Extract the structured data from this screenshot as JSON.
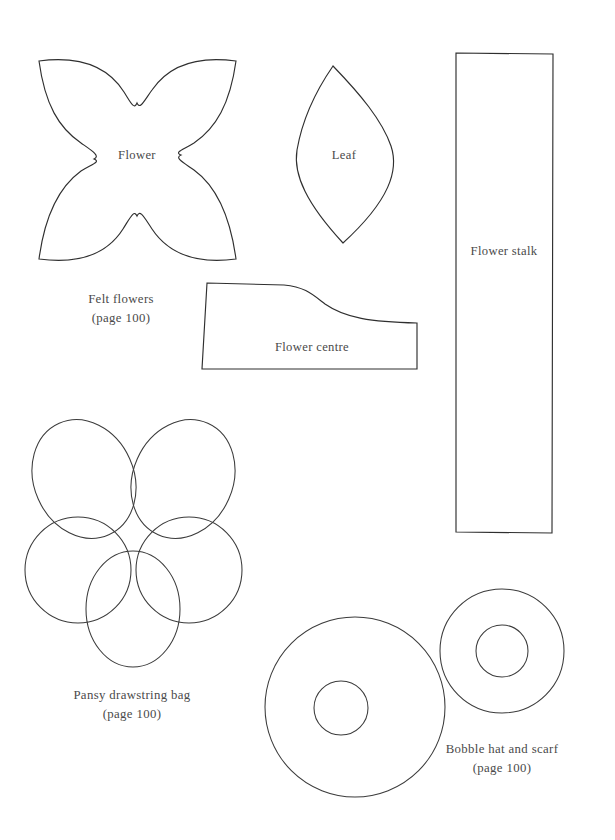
{
  "page": {
    "background_color": "#ffffff",
    "ink_color": "#2f2f2f",
    "text_color": "#4a4a4a",
    "width": 615,
    "height": 840,
    "document_type": "sewing pattern template sheet"
  },
  "shape_labels": {
    "flower": "Flower",
    "leaf": "Leaf",
    "flower_stalk": "Flower stalk",
    "flower_centre": "Flower centre"
  },
  "captions": [
    {
      "id": "felt-flowers",
      "title": "Felt flowers",
      "page_ref": "(page 100)"
    },
    {
      "id": "pansy-drawstring-bag",
      "title": "Pansy drawstring bag",
      "page_ref": "(page 100)"
    },
    {
      "id": "bobble-hat-and-scarf",
      "title": "Bobble hat and scarf",
      "page_ref": "(page 100)"
    }
  ],
  "shapes": {
    "flower": {
      "name": "four-petal flower template",
      "bounds": {
        "x": 36,
        "y": 58,
        "w": 202,
        "h": 204
      }
    },
    "leaf": {
      "name": "pointed leaf template",
      "bounds": {
        "x": 293,
        "y": 66,
        "w": 104,
        "h": 177
      }
    },
    "flower_stalk": {
      "name": "flower stalk rectangle template",
      "bounds": {
        "x": 455,
        "y": 53,
        "w": 98,
        "h": 480
      }
    },
    "flower_centre": {
      "name": "flower centre wedge template",
      "bounds": {
        "x": 202,
        "y": 283,
        "w": 215,
        "h": 87
      }
    },
    "pansy": {
      "name": "pansy five-petal template",
      "bounds": {
        "x": 25,
        "y": 418,
        "w": 230,
        "h": 245
      }
    },
    "bobble_large": {
      "name": "large bobble ring template",
      "center": {
        "x": 355,
        "y": 707
      },
      "outer_radius": 90,
      "inner_radius": 27
    },
    "bobble_small": {
      "name": "small bobble ring template",
      "center": {
        "x": 502,
        "y": 651
      },
      "outer_radius": 62,
      "inner_radius": 26
    }
  }
}
